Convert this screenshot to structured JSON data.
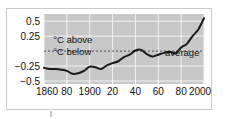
{
  "chart_data": {
    "type": "line",
    "title": "",
    "subtitle": "",
    "xlabel": "",
    "ylabel": "",
    "xlim": [
      1860,
      2000
    ],
    "ylim": [
      -0.55,
      0.62
    ],
    "grid": true,
    "legend_position": "none",
    "y_ticks": [
      0.5,
      0.25,
      -0.25,
      -0.5
    ],
    "y_tick_labels": [
      "0.5",
      "0.25",
      "−0.25",
      "−0.5"
    ],
    "x_ticks": [
      1860,
      1880,
      1900,
      1920,
      1940,
      1960,
      1980,
      2000
    ],
    "x_tick_labels": [
      "1860",
      "80",
      "1900",
      "20",
      "40",
      "60",
      "80",
      "2000"
    ],
    "reference_line": {
      "value": 0,
      "style": "dashed",
      "label": "average"
    },
    "annotations": [
      {
        "text": "°C above",
        "x": 1868,
        "y": 0.13
      },
      {
        "text": "°C below",
        "x": 1868,
        "y": -0.07
      },
      {
        "text": "average",
        "x": 1996,
        "y": -0.09
      }
    ],
    "series": [
      {
        "name": "Global temperature anomaly",
        "color": "#1a1a1a",
        "x": [
          1860,
          1865,
          1870,
          1875,
          1880,
          1885,
          1890,
          1895,
          1900,
          1905,
          1910,
          1915,
          1920,
          1925,
          1930,
          1935,
          1940,
          1945,
          1950,
          1955,
          1960,
          1965,
          1970,
          1975,
          1980,
          1985,
          1990,
          1995,
          2000
        ],
        "values": [
          -0.28,
          -0.3,
          -0.3,
          -0.31,
          -0.33,
          -0.38,
          -0.37,
          -0.33,
          -0.26,
          -0.27,
          -0.3,
          -0.24,
          -0.2,
          -0.17,
          -0.1,
          -0.06,
          0.01,
          0.02,
          -0.05,
          -0.09,
          -0.06,
          -0.03,
          -0.01,
          -0.04,
          0.06,
          0.12,
          0.25,
          0.36,
          0.55
        ]
      }
    ]
  },
  "axes": {
    "y_labels": [
      {
        "text": "0.5",
        "value": 0.5
      },
      {
        "text": "0.25",
        "value": 0.25
      },
      {
        "text": "−0.25",
        "value": -0.25
      },
      {
        "text": "−0.5",
        "value": -0.5
      }
    ],
    "x_labels": [
      {
        "text": "1860",
        "value": 1860
      },
      {
        "text": "80",
        "value": 1880
      },
      {
        "text": "1900",
        "value": 1900
      },
      {
        "text": "20",
        "value": 1920
      },
      {
        "text": "40",
        "value": 1940
      },
      {
        "text": "60",
        "value": 1960
      },
      {
        "text": "80",
        "value": 1980
      },
      {
        "text": "2000",
        "value": 2000
      }
    ]
  },
  "labels": {
    "above": "°C above",
    "below": "°C below",
    "average": "average"
  },
  "colors": {
    "plot_background": "#c8c8c8",
    "gridline": "#f2f2f2",
    "line": "#1a1a1a",
    "reference_line": "#4d4d4d",
    "frame_border": "#c9c9c9",
    "text": "#111111",
    "page_background": "#ffffff"
  }
}
